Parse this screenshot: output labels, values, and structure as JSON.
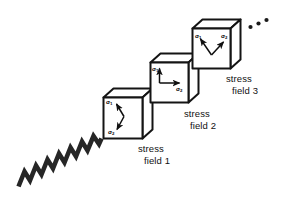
{
  "figure": {
    "width": 286,
    "height": 211,
    "background_color": "#ffffff",
    "stroke_color": "#1a1a1a",
    "fill_color": "#ffffff"
  },
  "wave": {
    "name": "seismic-wave",
    "shape": "zigzag",
    "cycles": 7,
    "start": [
      18,
      186
    ],
    "end": [
      101,
      136
    ]
  },
  "ellipsis": {
    "label": "...",
    "dots": 3
  },
  "blocks": [
    {
      "id": 1,
      "caption_line1": "stress",
      "caption_line2": "field 1",
      "sigma1": "σ",
      "sigma1_sub": "1",
      "sigma2": "σ",
      "sigma2_sub": "2",
      "orientation": "oblique-v",
      "front_face": [
        103,
        97,
        39,
        41
      ]
    },
    {
      "id": 2,
      "caption_line1": "stress",
      "caption_line2": "field 2",
      "sigma1": "σ",
      "sigma1_sub": "1",
      "sigma2": "σ",
      "sigma2_sub": "2",
      "orientation": "orthogonal-up-right",
      "front_face": [
        150,
        62,
        38,
        40
      ]
    },
    {
      "id": 3,
      "caption_line1": "stress",
      "caption_line2": "field 3",
      "sigma1": "σ",
      "sigma1_sub": "1",
      "sigma2": "σ",
      "sigma2_sub": "2",
      "orientation": "splayed-v",
      "front_face": [
        192,
        28,
        38,
        40
      ]
    }
  ]
}
